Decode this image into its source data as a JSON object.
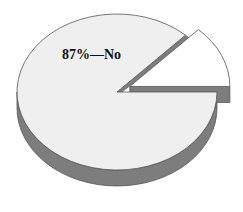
{
  "chart_data": {
    "type": "pie",
    "style": "3d-exploded",
    "title": "",
    "categories": [
      "No",
      "Other"
    ],
    "values": [
      87,
      13
    ],
    "unit": "%",
    "labels": [
      "87%—No",
      ""
    ],
    "exploded": [
      false,
      true
    ],
    "legend": "none",
    "colors": {
      "No": "#efefef",
      "Other": "#ffffff",
      "side": "#7d7d7d",
      "edge": "#555555"
    }
  }
}
